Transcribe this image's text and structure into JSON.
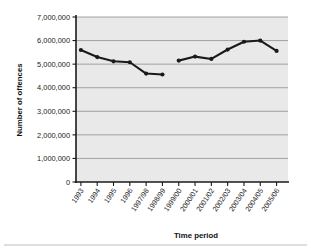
{
  "chart_data": {
    "type": "line",
    "title": "",
    "xlabel": "Time period",
    "ylabel": "Number of offences",
    "categories": [
      "1993",
      "1994",
      "1995",
      "1996",
      "1997/98",
      "1998/99",
      "1999/00",
      "2000/01",
      "2001/02",
      "2002/03",
      "2003/04",
      "2004/05",
      "2005/06"
    ],
    "values": [
      5600000,
      5300000,
      5120000,
      5080000,
      4600000,
      4560000,
      5150000,
      5320000,
      5220000,
      5620000,
      5950000,
      6000000,
      5560000
    ],
    "series": [
      {
        "name": "Number of offences",
        "segments": [
          {
            "categories": [
              "1993",
              "1994",
              "1995",
              "1996",
              "1997/98",
              "1998/99"
            ],
            "values": [
              5600000,
              5300000,
              5120000,
              5080000,
              4600000,
              4560000
            ]
          },
          {
            "categories": [
              "1999/00",
              "2000/01",
              "2001/02",
              "2002/03",
              "2003/04",
              "2004/05",
              "2005/06"
            ],
            "values": [
              5150000,
              5320000,
              5220000,
              5620000,
              5950000,
              6000000,
              5560000
            ]
          }
        ]
      }
    ],
    "ylim": [
      0,
      7000000
    ],
    "yticks": [
      0,
      1000000,
      2000000,
      3000000,
      4000000,
      5000000,
      6000000,
      7000000
    ],
    "ytick_labels": [
      "0",
      "1,000,000",
      "2,000,000",
      "3,000,000",
      "4,000,000",
      "5,000,000",
      "6,000,000",
      "7,000,000"
    ],
    "grid": true,
    "legend": "none",
    "marker": "filled-circle",
    "line_color": "#1a1a1a",
    "plot_background": "#e9e9e9",
    "gridline_color": "#8e8e8e"
  }
}
